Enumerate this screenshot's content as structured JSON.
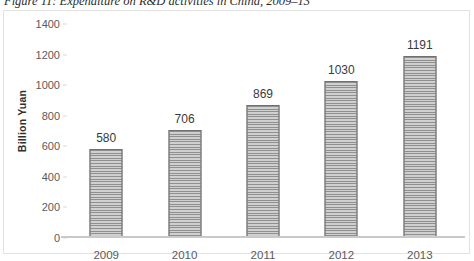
{
  "figure": {
    "caption": "Figure 11: Expenditure on R&D activities in China, 2009–13"
  },
  "chart_data": {
    "type": "bar",
    "title": "Figure 11: Expenditure on R&D activities in China, 2009–13",
    "categories": [
      "2009",
      "2010",
      "2011",
      "2012",
      "2013"
    ],
    "values": [
      580,
      706,
      869,
      1030,
      1191
    ],
    "data_labels": [
      "580",
      "706",
      "869",
      "1030",
      "1191"
    ],
    "xlabel": "",
    "ylabel": "Billion Yuan",
    "ylim": [
      0,
      1400
    ],
    "ytick_labels": [
      "1400",
      "1200",
      "1000",
      "800",
      "600",
      "400",
      "200",
      "0"
    ],
    "ytick_values": [
      1400,
      1200,
      1000,
      800,
      600,
      400,
      200,
      0
    ],
    "grid": false,
    "legend": null,
    "series": [
      {
        "name": "Expenditure on R&D activities",
        "values": [
          580,
          706,
          869,
          1030,
          1191
        ]
      }
    ],
    "colors": {
      "bar_fill": "#9d9d9d",
      "bar_stripe_dark": "#8f8f8f",
      "bar_stripe_light": "#d0d0d0",
      "bar_border": "#6f6f6f",
      "axis_line": "#c9c9c9",
      "frame_border": "#e2e2e2",
      "tick_text": "#5a5a5a",
      "label_text": "#3a3a3a"
    }
  }
}
